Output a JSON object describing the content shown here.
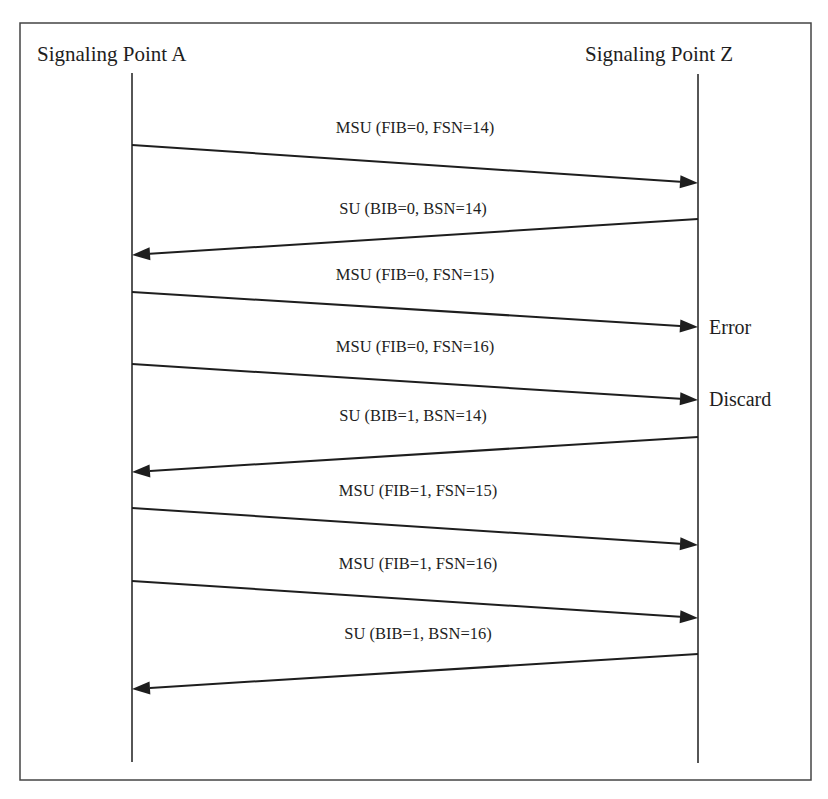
{
  "diagram": {
    "type": "sequence",
    "frame": {
      "x1": 20,
      "y1": 23,
      "x2": 811,
      "y2": 780,
      "color": "#444444"
    },
    "participants": [
      {
        "id": "A",
        "label": "Signaling Point A",
        "x": 132,
        "label_x": 37,
        "y_top": 73,
        "y_bottom": 762
      },
      {
        "id": "Z",
        "label": "Signaling Point Z",
        "x": 698,
        "label_x": 585,
        "y_top": 74,
        "y_bottom": 763
      }
    ],
    "messages": [
      {
        "label": "MSU (FIB=0, FSN=14)",
        "from": "A",
        "to": "Z",
        "y_from": 145,
        "y_to": 183,
        "label_x": 415,
        "label_y": 119
      },
      {
        "label": "SU (BIB=0, BSN=14)",
        "from": "Z",
        "to": "A",
        "y_from": 219,
        "y_to": 255,
        "label_x": 413,
        "label_y": 200
      },
      {
        "label": "MSU (FIB=0, FSN=15)",
        "from": "A",
        "to": "Z",
        "y_from": 292,
        "y_to": 327,
        "label_x": 415,
        "label_y": 266
      },
      {
        "label": "MSU (FIB=0, FSN=16)",
        "from": "A",
        "to": "Z",
        "y_from": 364,
        "y_to": 400,
        "label_x": 415,
        "label_y": 338
      },
      {
        "label": "SU (BIB=1, BSN=14)",
        "from": "Z",
        "to": "A",
        "y_from": 437,
        "y_to": 472,
        "label_x": 413,
        "label_y": 407
      },
      {
        "label": "MSU (FIB=1, FSN=15)",
        "from": "A",
        "to": "Z",
        "y_from": 508,
        "y_to": 545,
        "label_x": 418,
        "label_y": 482
      },
      {
        "label": "MSU (FIB=1, FSN=16)",
        "from": "A",
        "to": "Z",
        "y_from": 581,
        "y_to": 618,
        "label_x": 418,
        "label_y": 555
      },
      {
        "label": "SU (BIB=1, BSN=16)",
        "from": "Z",
        "to": "A",
        "y_from": 654,
        "y_to": 689,
        "label_x": 418,
        "label_y": 625
      }
    ],
    "notes": [
      {
        "label": "Error",
        "x": 709,
        "y": 316
      },
      {
        "label": "Discard",
        "x": 709,
        "y": 388
      }
    ],
    "colors": {
      "line": "#1e1e1e",
      "frame": "#444444",
      "text": "#1e1e1e",
      "background": "#ffffff"
    }
  }
}
